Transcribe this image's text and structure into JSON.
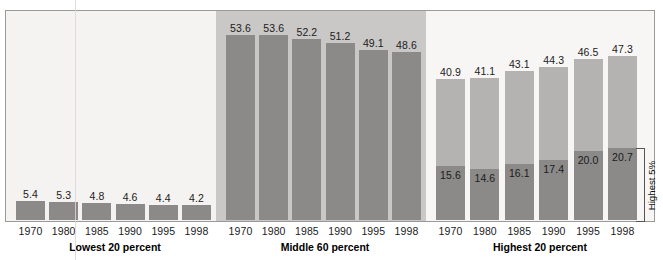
{
  "chart_data": {
    "type": "bar",
    "title": "",
    "subtitle": "",
    "xlabel": "",
    "ylabel": "",
    "ylim": [
      0,
      60
    ],
    "grid": false,
    "legend_position": "none",
    "stacked": true,
    "categories": [
      "1970",
      "1980",
      "1985",
      "1990",
      "1995",
      "1998"
    ],
    "groups": [
      {
        "name": "Lowest 20 percent",
        "label": "Lowest 20 percent",
        "stacked": false,
        "series": [
          {
            "name": "Lowest 20 percent",
            "values": [
              5.4,
              5.3,
              4.8,
              4.6,
              4.4,
              4.2
            ]
          }
        ],
        "labels": [
          "5.4",
          "5.3",
          "4.8",
          "4.6",
          "4.4",
          "4.2"
        ]
      },
      {
        "name": "Middle 60 percent",
        "label": "Middle 60 percent",
        "stacked": false,
        "series": [
          {
            "name": "Middle 60 percent",
            "values": [
              53.6,
              53.6,
              52.2,
              51.2,
              49.1,
              48.6
            ]
          }
        ],
        "labels": [
          "53.6",
          "53.6",
          "52.2",
          "51.2",
          "49.1",
          "48.6"
        ]
      },
      {
        "name": "Highest 20 percent",
        "label": "Highest 20 percent",
        "stacked": true,
        "series": [
          {
            "name": "Highest 20 percent total",
            "values": [
              40.9,
              41.1,
              43.1,
              44.3,
              46.5,
              47.3
            ]
          },
          {
            "name": "Highest 5%",
            "values": [
              15.6,
              14.6,
              16.1,
              17.4,
              20.0,
              20.7
            ]
          }
        ],
        "labels_total": [
          "40.9",
          "41.1",
          "43.1",
          "44.3",
          "46.5",
          "47.3"
        ],
        "labels_top5": [
          "15.6",
          "14.6",
          "16.1",
          "17.4",
          "20.0",
          "20.7"
        ]
      }
    ],
    "annotations": [
      {
        "name": "highest-5-percent-bracket",
        "text": "Highest 5%"
      }
    ],
    "colors": {
      "bar_dark": "#8b8a88",
      "bar_light": "#b4b3b1",
      "panel_middle_bg": "#c9c8c6",
      "panel_light_bg": "#f4f3f1",
      "panel_right_bg": "#f7f6f5",
      "frame_border": "#9a9a9a",
      "text": "#1b1b1b"
    }
  },
  "axis": {
    "ticks": [
      "1970",
      "1980",
      "1985",
      "1990",
      "1995",
      "1998"
    ]
  },
  "groups_labels": {
    "lowest": "Lowest 20 percent",
    "middle": "Middle 60 percent",
    "highest": "Highest 20 percent"
  },
  "bracket": {
    "label": "Highest 5%"
  }
}
